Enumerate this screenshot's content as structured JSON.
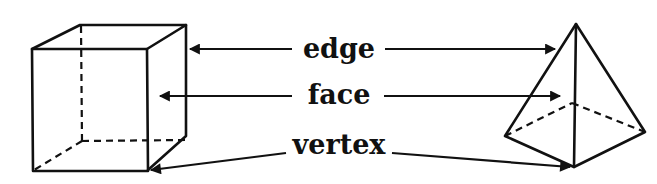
{
  "labels": {
    "edge": "edge",
    "face": "face",
    "vertex": "vertex"
  },
  "shapes": {
    "left": "cube",
    "right": "square-pyramid"
  },
  "colors": {
    "ink": "#111111",
    "background": "#ffffff"
  }
}
